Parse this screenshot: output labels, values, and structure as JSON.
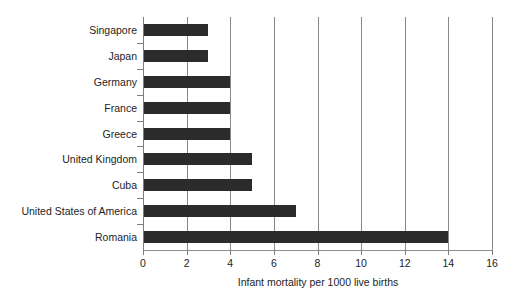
{
  "chart_data": {
    "type": "bar",
    "orientation": "horizontal",
    "title": "",
    "subtitle": "",
    "xlabel": "Infant mortality per 1000 live births",
    "ylabel": "",
    "categories": [
      "Singapore",
      "Japan",
      "Germany",
      "France",
      "Greece",
      "United Kingdom",
      "Cuba",
      "United States of America",
      "Romania"
    ],
    "values": [
      3,
      3,
      4,
      4,
      4,
      5,
      5,
      7,
      14
    ],
    "xlim": [
      0,
      16
    ],
    "xticks": [
      0,
      2,
      4,
      6,
      8,
      10,
      12,
      14,
      16
    ],
    "xtick_labels": [
      "0",
      "2",
      "4",
      "6",
      "8",
      "10",
      "12",
      "14",
      "16"
    ],
    "grid": "vertical",
    "legend": "none",
    "bar_color": "#2b2b2b",
    "grid_color": "#8a8a8a",
    "axis_color": "#7d7d7d",
    "text_color": "#242424",
    "background_color": "#ffffff"
  }
}
